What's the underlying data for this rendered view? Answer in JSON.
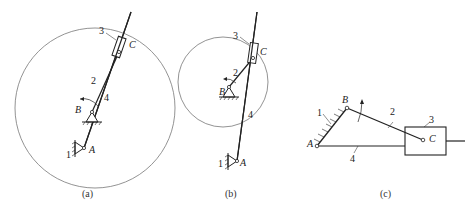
{
  "figures": [
    {
      "id": "a",
      "caption": "(a)",
      "labels": {
        "frame": "1",
        "crank": "2",
        "slider": "3",
        "guide": "4",
        "pivot_a": "A",
        "pivot_b": "B",
        "joint_c": "C"
      }
    },
    {
      "id": "b",
      "caption": "(b)",
      "labels": {
        "frame": "1",
        "crank": "2",
        "slider": "3",
        "guide": "4",
        "pivot_a": "A",
        "pivot_b": "B",
        "joint_c": "C"
      }
    },
    {
      "id": "c",
      "caption": "(c)",
      "labels": {
        "frame": "1",
        "crank": "2",
        "slider": "3",
        "guide": "4",
        "pivot_a": "A",
        "pivot_b": "B",
        "joint_c": "C"
      }
    }
  ],
  "colors": {
    "line": "#222222",
    "circle": "#777777",
    "background": "#ffffff"
  }
}
